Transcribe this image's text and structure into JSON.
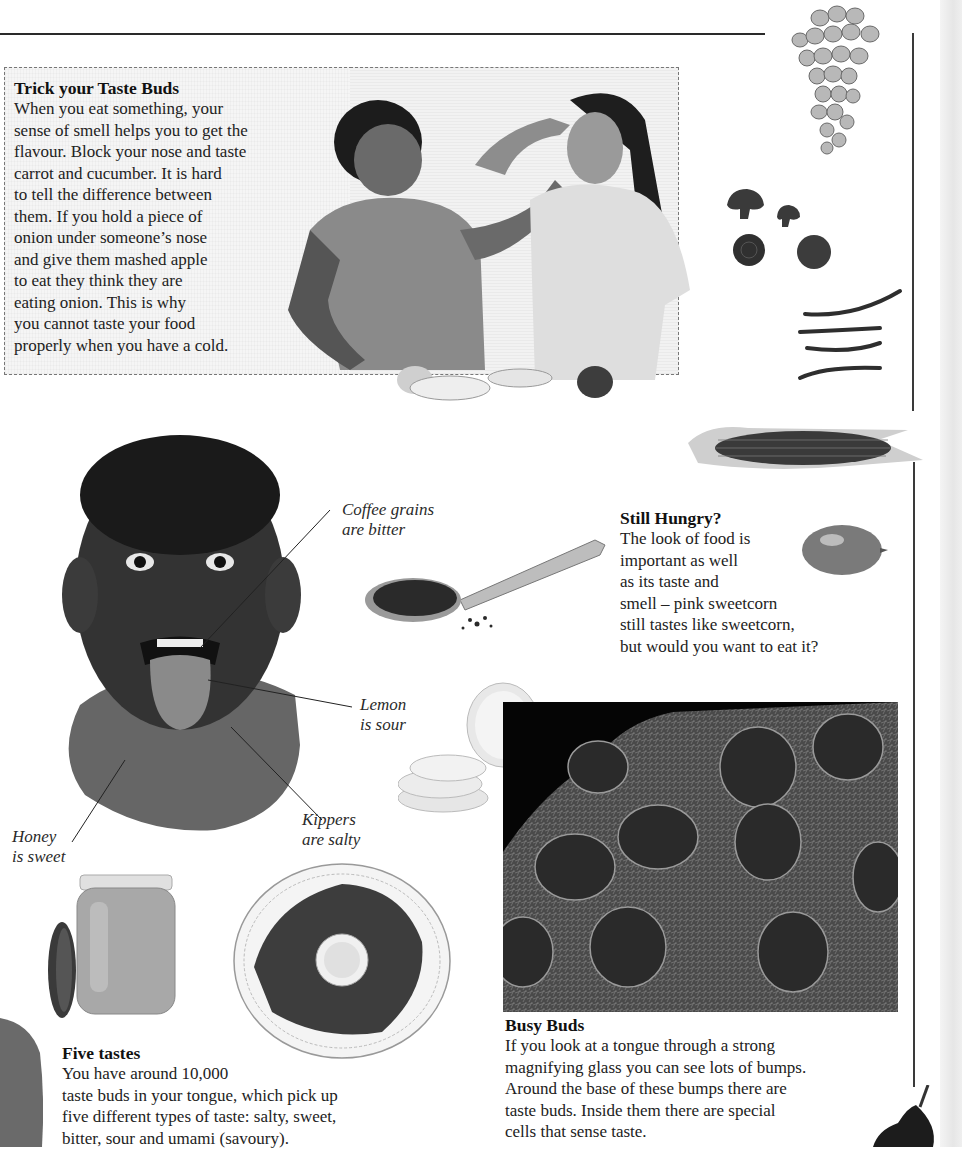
{
  "page": {
    "background": "#ffffff",
    "ink": "#1e1e1e",
    "rule_color": "#2a2a2a"
  },
  "trick": {
    "heading": "Trick your Taste Buds",
    "lines": [
      "When you eat something, your",
      "sense of smell helps you to get the",
      "flavour. Block your nose and taste",
      "carrot and cucumber. It is hard",
      "to tell the difference between",
      "them. If you hold a piece of",
      "onion under someone’s nose",
      "and give them mashed apple",
      "to eat they think they are",
      "eating onion. This is why",
      "you cannot taste your food",
      "properly when you have a cold."
    ],
    "photo_alt": "Boy feeding a girl who is holding her nose"
  },
  "tongue_labels": {
    "coffee": [
      "Coffee grains",
      "are bitter"
    ],
    "lemon": [
      "Lemon",
      "is sour"
    ],
    "kippers": [
      "Kippers",
      "are salty"
    ],
    "honey": [
      "Honey",
      "is sweet"
    ]
  },
  "still_hungry": {
    "heading": "Still Hungry?",
    "lines": [
      "The look of food is",
      "important as well",
      "as its taste and",
      "smell – pink sweetcorn",
      "still tastes like sweetcorn,",
      "but would you want to eat it?"
    ]
  },
  "five_tastes": {
    "heading": "Five tastes",
    "lines": [
      "You have around 10,000",
      "taste buds in your tongue, which pick up",
      "five different types of taste: salty, sweet,",
      "bitter, sour and umami (savoury)."
    ]
  },
  "busy_buds": {
    "heading": "Busy Buds",
    "lines": [
      "If you look at a tongue through a strong",
      "magnifying glass you can see lots of bumps.",
      "Around the base of these bumps there are",
      "taste buds. Inside them there are special",
      "cells that sense taste."
    ]
  },
  "images": {
    "grapes": "grapes-image",
    "mushrooms": "mushrooms-image",
    "beans": "green-beans-image",
    "corn": "corn-cob-image",
    "lemon": "lemon-image",
    "boy": "boy-sticking-out-tongue-image",
    "spoon": "coffee-spoon-image",
    "lemon_slices": "lemon-slices-image",
    "micrograph": "tongue-micrograph-image",
    "honey_jar": "honey-jar-image",
    "kippers": "kippers-plate-image",
    "pear": "pear-image"
  }
}
